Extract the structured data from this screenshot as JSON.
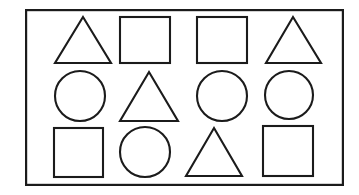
{
  "figure": {
    "background_color": "#ffffff",
    "stroke_color": "#1b1b1b",
    "stroke_width": 2.1,
    "frame": {
      "name": "outer-rectangle-border",
      "x": 25,
      "y": 9,
      "width": 319,
      "height": 177,
      "stroke_width": 2.2
    },
    "grid": {
      "rows": 3,
      "columns": 4,
      "total_shapes": 12
    },
    "shape_counts": {
      "triangle": 4,
      "square": 5,
      "circle": 4
    },
    "shapes": [
      {
        "id": "r1c1",
        "type": "triangle",
        "row": 1,
        "col": 1,
        "cx": 83,
        "cy": 40,
        "size": 56,
        "apex_x": 83,
        "apex_y": 17,
        "base_left_x": 55,
        "base_right_x": 111,
        "base_y": 63
      },
      {
        "id": "r1c2",
        "type": "square",
        "row": 1,
        "col": 2,
        "cx": 145,
        "cy": 40,
        "x": 120,
        "y": 17,
        "width": 50,
        "height": 46
      },
      {
        "id": "r1c3",
        "type": "square",
        "row": 1,
        "col": 3,
        "cx": 222,
        "cy": 40,
        "x": 197,
        "y": 17,
        "width": 50,
        "height": 46
      },
      {
        "id": "r1c4",
        "type": "triangle",
        "row": 1,
        "col": 4,
        "cx": 293,
        "cy": 40,
        "size": 56,
        "apex_x": 293,
        "apex_y": 17,
        "base_left_x": 266,
        "base_right_x": 321,
        "base_y": 63
      },
      {
        "id": "r2c1",
        "type": "circle",
        "row": 2,
        "col": 1,
        "cx": 80,
        "cy": 96,
        "r": 25
      },
      {
        "id": "r2c2",
        "type": "triangle",
        "row": 2,
        "col": 2,
        "cx": 149,
        "cy": 96,
        "size": 58,
        "apex_x": 149,
        "apex_y": 72,
        "base_left_x": 120,
        "base_right_x": 178,
        "base_y": 121
      },
      {
        "id": "r2c3",
        "type": "circle",
        "row": 2,
        "col": 3,
        "cx": 222,
        "cy": 96,
        "r": 25
      },
      {
        "id": "r2c4",
        "type": "circle",
        "row": 2,
        "col": 4,
        "cx": 289,
        "cy": 95,
        "r": 24
      },
      {
        "id": "r3c1",
        "type": "square",
        "row": 3,
        "col": 1,
        "cx": 78,
        "cy": 152,
        "x": 54,
        "y": 128,
        "width": 49,
        "height": 49
      },
      {
        "id": "r3c2",
        "type": "circle",
        "row": 3,
        "col": 2,
        "cx": 145,
        "cy": 152,
        "r": 25
      },
      {
        "id": "r3c3",
        "type": "triangle",
        "row": 3,
        "col": 3,
        "cx": 214,
        "cy": 152,
        "size": 56,
        "apex_x": 214,
        "apex_y": 128,
        "base_left_x": 186,
        "base_right_x": 242,
        "base_y": 176
      },
      {
        "id": "r3c4",
        "type": "square",
        "row": 3,
        "col": 4,
        "cx": 288,
        "cy": 151,
        "x": 263,
        "y": 126,
        "width": 50,
        "height": 50
      }
    ]
  }
}
